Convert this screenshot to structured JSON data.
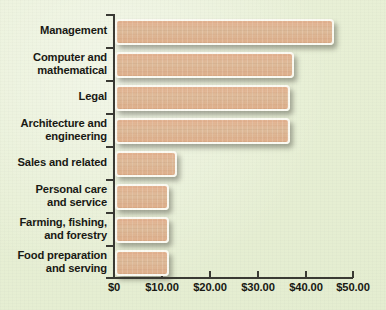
{
  "chart_data": {
    "type": "bar",
    "orientation": "horizontal",
    "title": "",
    "subtitle": "",
    "xlabel": "",
    "ylabel": "",
    "categories": [
      "Management",
      "Computer and mathematical",
      "Legal",
      "Architecture and engineering",
      "Sales and related",
      "Personal care and service",
      "Farming, fishing, and forestry",
      "Food preparation and serving"
    ],
    "values": [
      45.4,
      37.0,
      36.0,
      36.0,
      12.2,
      10.6,
      10.6,
      10.6
    ],
    "xlim": [
      0,
      50
    ],
    "xticks": [
      0,
      10,
      20,
      30,
      40,
      50
    ],
    "xtick_labels": [
      "$0",
      "$10.00",
      "$20.00",
      "$30.00",
      "$40.00",
      "$50.00"
    ],
    "grid": false,
    "legend": null,
    "bar_color": "#dfb291",
    "bar_border_color": "#fbfaf2",
    "background_color": "#e8efd5",
    "axis_color": "#3a3a34",
    "text_color": "#191914"
  },
  "categories_display": [
    {
      "line1": "Management",
      "line2": ""
    },
    {
      "line1": "Computer and",
      "line2": "mathematical"
    },
    {
      "line1": "Legal",
      "line2": ""
    },
    {
      "line1": "Architecture and",
      "line2": "engineering"
    },
    {
      "line1": "Sales and related",
      "line2": ""
    },
    {
      "line1": "Personal care",
      "line2": "and service"
    },
    {
      "line1": "Farming, fishing,",
      "line2": "and forestry"
    },
    {
      "line1": "Food preparation",
      "line2": "and serving"
    }
  ],
  "xtick_labels": {
    "t0": "$0",
    "t1": "$10.00",
    "t2": "$20.00",
    "t3": "$30.00",
    "t4": "$40.00",
    "t5": "$50.00"
  }
}
